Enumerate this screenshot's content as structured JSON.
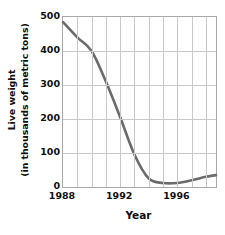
{
  "chart_data": {
    "type": "line",
    "title": "",
    "xlabel": "Year",
    "ylabel_line1": "Live weight",
    "ylabel_line2": "(in thousands of metric tons)",
    "xlim": [
      1988,
      1998.7
    ],
    "ylim": [
      0,
      500
    ],
    "yticks": [
      0,
      100,
      200,
      300,
      400,
      500
    ],
    "ytick_labels": [
      "0",
      "100",
      "200",
      "300",
      "400",
      "500"
    ],
    "xticks": [
      1988,
      1992,
      1996
    ],
    "xtick_labels": [
      "1988",
      "1992",
      "1996"
    ],
    "grid": true,
    "grid_x_step": 1,
    "grid_y_step": 100,
    "legend": null,
    "line_color": "#6b6b6b",
    "line_width": 2.6,
    "axis_color": "#a8a8a8",
    "grid_color": "#c9c9c9",
    "x": [
      1988,
      1989,
      1990,
      1991,
      1992,
      1993,
      1994,
      1995,
      1996,
      1997,
      1998,
      1998.7
    ],
    "values": [
      485,
      440,
      400,
      310,
      205,
      95,
      25,
      12,
      12,
      20,
      30,
      35
    ],
    "series": [
      {
        "name": "Live weight",
        "values": [
          485,
          440,
          400,
          310,
          205,
          95,
          25,
          12,
          12,
          20,
          30,
          35
        ]
      }
    ]
  }
}
